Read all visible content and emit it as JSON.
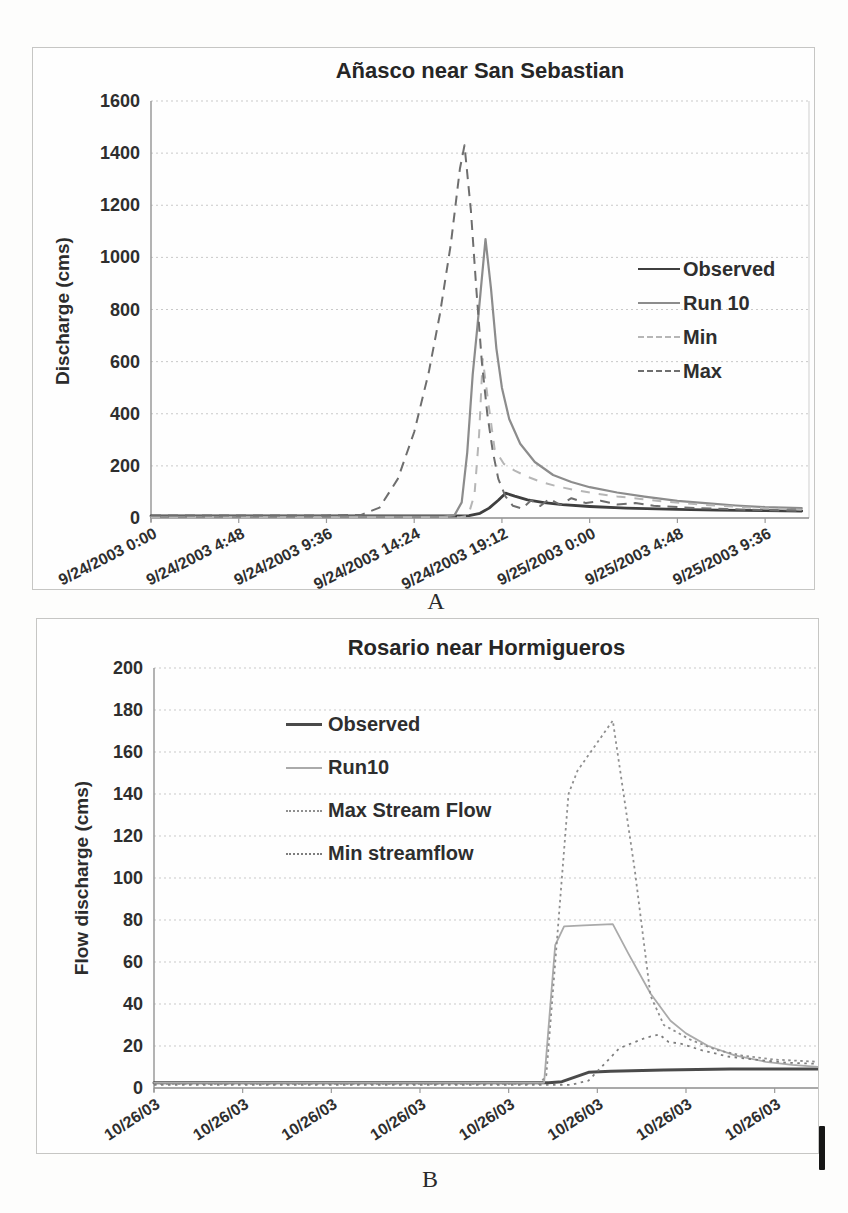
{
  "captions": {
    "a": "A",
    "b": "B"
  },
  "chart_data": [
    {
      "id": "chart-a",
      "type": "line",
      "title": "Añasco near San Sebastian",
      "ylabel": "Discharge (cms)",
      "xlabel": "",
      "ylim": [
        0,
        1600
      ],
      "ytick_step": 200,
      "xlim": [
        0,
        36
      ],
      "xtick_positions": [
        0,
        4.8,
        9.6,
        14.4,
        19.2,
        24,
        28.8,
        33.6
      ],
      "xtick_labels": [
        "9/24/2003 0:00",
        "9/24/2003 4:48",
        "9/24/2003 9:36",
        "9/24/2003 14:24",
        "9/24/2003 19:12",
        "9/25/2003 0:00",
        "9/25/2003 4:48",
        "9/25/2003 9:36"
      ],
      "xtick_rotation": -27,
      "grid": "horizontal-dotted",
      "legend_position": "inside-right",
      "axis_color": "#9a9a9a",
      "grid_color": "#c9c9c9",
      "text_color": "#2e2e2e",
      "x_unit": "hours from 9/24/2003 0:00",
      "series": [
        {
          "name": "Observed",
          "color": "#3f3f3f",
          "width": 2.8,
          "dash": null,
          "points": [
            [
              0,
              8
            ],
            [
              3,
              8
            ],
            [
              6,
              8
            ],
            [
              9,
              8
            ],
            [
              12,
              8
            ],
            [
              14.4,
              8
            ],
            [
              16.5,
              8
            ],
            [
              17.4,
              9
            ],
            [
              18.0,
              18
            ],
            [
              18.5,
              38
            ],
            [
              19.0,
              68
            ],
            [
              19.4,
              95
            ],
            [
              19.9,
              84
            ],
            [
              20.6,
              70
            ],
            [
              21.5,
              59
            ],
            [
              22.5,
              51
            ],
            [
              24,
              44
            ],
            [
              26,
              38
            ],
            [
              28.8,
              33
            ],
            [
              31,
              30
            ],
            [
              33.6,
              28
            ],
            [
              35.6,
              27
            ]
          ]
        },
        {
          "name": "Run 10",
          "color": "#8c8c8c",
          "width": 2.2,
          "dash": null,
          "points": [
            [
              0,
              5
            ],
            [
              4.8,
              5
            ],
            [
              9.6,
              5
            ],
            [
              14.4,
              5
            ],
            [
              16.0,
              5
            ],
            [
              16.6,
              10
            ],
            [
              17.0,
              60
            ],
            [
              17.3,
              250
            ],
            [
              17.6,
              550
            ],
            [
              17.85,
              730
            ],
            [
              18.05,
              880
            ],
            [
              18.3,
              1070
            ],
            [
              18.6,
              880
            ],
            [
              18.9,
              650
            ],
            [
              19.2,
              500
            ],
            [
              19.6,
              380
            ],
            [
              20.2,
              285
            ],
            [
              21,
              215
            ],
            [
              22,
              165
            ],
            [
              23,
              138
            ],
            [
              24,
              118
            ],
            [
              25.5,
              98
            ],
            [
              27,
              82
            ],
            [
              28.8,
              66
            ],
            [
              30.5,
              56
            ],
            [
              32,
              48
            ],
            [
              33.6,
              42
            ],
            [
              35.6,
              38
            ]
          ]
        },
        {
          "name": "Min",
          "color": "#b6b6b6",
          "width": 2,
          "dash": "9 9",
          "points": [
            [
              0,
              3
            ],
            [
              4.8,
              3
            ],
            [
              9.6,
              3
            ],
            [
              14.4,
              3
            ],
            [
              16.9,
              3
            ],
            [
              17.35,
              8
            ],
            [
              17.7,
              90
            ],
            [
              17.95,
              320
            ],
            [
              18.15,
              610
            ],
            [
              18.5,
              420
            ],
            [
              18.8,
              265
            ],
            [
              19.3,
              208
            ],
            [
              19.9,
              182
            ],
            [
              20.6,
              158
            ],
            [
              21.4,
              137
            ],
            [
              22.3,
              120
            ],
            [
              23.3,
              106
            ],
            [
              24.3,
              94
            ],
            [
              25.5,
              83
            ],
            [
              26.8,
              73
            ],
            [
              28,
              64
            ],
            [
              29.3,
              56
            ],
            [
              30.6,
              49
            ],
            [
              32,
              43
            ],
            [
              33.6,
              37
            ],
            [
              35.6,
              32
            ]
          ]
        },
        {
          "name": "Max",
          "color": "#6e6e6e",
          "width": 2,
          "dash": "10 7",
          "points": [
            [
              0,
              10
            ],
            [
              4.8,
              10
            ],
            [
              9.6,
              10
            ],
            [
              11.5,
              12
            ],
            [
              12.5,
              40
            ],
            [
              13.5,
              150
            ],
            [
              14.4,
              330
            ],
            [
              15.2,
              560
            ],
            [
              15.8,
              780
            ],
            [
              16.4,
              1050
            ],
            [
              16.9,
              1340
            ],
            [
              17.15,
              1430
            ],
            [
              17.5,
              1180
            ],
            [
              17.8,
              880
            ],
            [
              18.1,
              600
            ],
            [
              18.4,
              400
            ],
            [
              18.7,
              255
            ],
            [
              19.0,
              150
            ],
            [
              19.4,
              82
            ],
            [
              19.8,
              47
            ],
            [
              20.3,
              36
            ],
            [
              20.8,
              68
            ],
            [
              21.3,
              46
            ],
            [
              21.8,
              74
            ],
            [
              22.4,
              50
            ],
            [
              23,
              76
            ],
            [
              23.8,
              57
            ],
            [
              24.6,
              66
            ],
            [
              25.5,
              52
            ],
            [
              26.5,
              57
            ],
            [
              27.5,
              47
            ],
            [
              28.8,
              42
            ],
            [
              30,
              38
            ],
            [
              31.5,
              34
            ],
            [
              33.6,
              30
            ],
            [
              35.6,
              28
            ]
          ]
        }
      ]
    },
    {
      "id": "chart-b",
      "type": "line",
      "title": "Rosario near Hormigueros",
      "ylabel": "Flow discharge (cms)",
      "xlabel": "",
      "ylim": [
        0,
        200
      ],
      "ytick_step": 20,
      "xlim": [
        0,
        30
      ],
      "xtick_positions": [
        0,
        4,
        8,
        12,
        16,
        20,
        24,
        28
      ],
      "xtick_labels": [
        "10/26/03",
        "10/26/03",
        "10/26/03",
        "10/26/03",
        "10/26/03",
        "10/26/03",
        "10/26/03",
        "10/26/03"
      ],
      "xtick_rotation": -33,
      "grid": "horizontal-dotted",
      "legend_position": "inside-left",
      "axis_color": "#9a9a9a",
      "grid_color": "#c9c9c9",
      "text_color": "#2e2e2e",
      "x_unit": "10/26/03 time axis",
      "series": [
        {
          "name": "Observed",
          "color": "#4a4a4a",
          "width": 3,
          "dash": null,
          "points": [
            [
              0,
              2.5
            ],
            [
              4,
              2.5
            ],
            [
              8,
              2.5
            ],
            [
              12,
              2.5
            ],
            [
              16,
              2.5
            ],
            [
              17.8,
              2.5
            ],
            [
              18.4,
              3
            ],
            [
              19.6,
              7.5
            ],
            [
              20.6,
              8
            ],
            [
              23,
              8.5
            ],
            [
              26,
              9
            ],
            [
              30,
              9
            ]
          ]
        },
        {
          "name": "Run10",
          "color": "#aaaaaa",
          "width": 1.8,
          "dash": null,
          "points": [
            [
              0,
              2.5
            ],
            [
              6,
              2.5
            ],
            [
              12,
              2.5
            ],
            [
              17.6,
              2.5
            ],
            [
              18.1,
              68
            ],
            [
              18.5,
              77
            ],
            [
              19.4,
              77.5
            ],
            [
              20.7,
              78
            ],
            [
              21.4,
              64
            ],
            [
              22.4,
              45
            ],
            [
              23.3,
              32
            ],
            [
              24,
              26
            ],
            [
              25,
              20
            ],
            [
              26.2,
              15.5
            ],
            [
              27.6,
              12.5
            ],
            [
              28.8,
              11
            ],
            [
              30,
              10
            ]
          ]
        },
        {
          "name": "Max Stream Flow",
          "color": "#8f8f8f",
          "width": 1.8,
          "dash": "2.5 3.5",
          "points": [
            [
              0,
              2
            ],
            [
              6,
              2
            ],
            [
              12,
              2
            ],
            [
              17.4,
              2
            ],
            [
              17.7,
              6
            ],
            [
              18.7,
              140
            ],
            [
              19.1,
              151
            ],
            [
              20.7,
              175
            ],
            [
              21.7,
              103
            ],
            [
              22.4,
              44
            ],
            [
              23,
              30
            ],
            [
              24.2,
              23
            ],
            [
              25.4,
              18
            ],
            [
              26.5,
              15.5
            ],
            [
              28,
              13.5
            ],
            [
              30,
              12.5
            ]
          ]
        },
        {
          "name": "Min streamflow",
          "color": "#7d7d7d",
          "width": 1.8,
          "dash": "2.5 4.5",
          "points": [
            [
              0,
              1.5
            ],
            [
              6,
              1.5
            ],
            [
              12,
              1.5
            ],
            [
              18.8,
              1.5
            ],
            [
              19.6,
              3.5
            ],
            [
              21,
              19
            ],
            [
              22.2,
              24
            ],
            [
              22.8,
              25.5
            ],
            [
              23.2,
              22
            ],
            [
              23.8,
              21
            ],
            [
              24.7,
              18
            ],
            [
              25.9,
              15
            ],
            [
              27.1,
              13.5
            ],
            [
              28.6,
              12
            ],
            [
              30,
              11.5
            ]
          ]
        }
      ]
    }
  ]
}
